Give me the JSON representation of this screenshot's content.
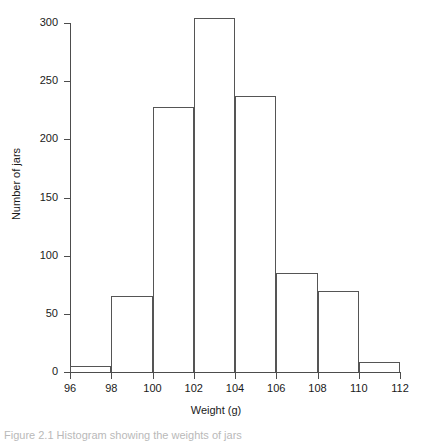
{
  "figure": {
    "caption": "Figure 2.1 Histogram showing the weights of jars"
  },
  "chart_data": {
    "type": "bar",
    "title": "",
    "subtitle": "",
    "xlabel": "Weight (g)",
    "ylabel": "Number of jars",
    "xlim": [
      96,
      112
    ],
    "ylim": [
      0,
      300
    ],
    "bin_width": 2,
    "grid": false,
    "legend": null,
    "x_ticks": [
      96,
      98,
      100,
      102,
      104,
      106,
      108,
      110,
      112
    ],
    "x_tick_labels": [
      "96",
      "98",
      "100",
      "102",
      "104",
      "106",
      "108",
      "110",
      "112"
    ],
    "y_ticks": [
      0,
      50,
      100,
      150,
      200,
      250,
      300
    ],
    "y_tick_labels": [
      "0",
      "50",
      "100",
      "150",
      "200",
      "250",
      "300"
    ],
    "categories": [
      "96-98",
      "98-100",
      "100-102",
      "102-104",
      "104-106",
      "106-108",
      "108-110",
      "110-112"
    ],
    "bin_edges": [
      96,
      98,
      100,
      102,
      104,
      106,
      108,
      110,
      112
    ],
    "values": [
      5,
      65,
      228,
      304,
      237,
      85,
      70,
      9
    ],
    "bar_fill_color": "#ffffff",
    "bar_edge_color": "#555555",
    "axis_color": "#4d4d4d",
    "text_color": "#1a1a1a",
    "background_color": "#ffffff"
  }
}
